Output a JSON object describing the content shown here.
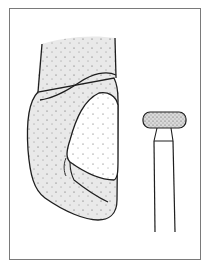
{
  "figure": {
    "colors": {
      "frame": "#7a7a7a",
      "outline": "#1e1e1e",
      "enamel_fill": "#e9e9e9",
      "dentin_fill": "#ffffff",
      "stipple": "#3a3a3a",
      "bur_fill": "#dedede"
    },
    "parts": {
      "tooth": "tooth-crown",
      "prepared_surface": "cavity-preparation",
      "tool": "diamond-bur"
    }
  }
}
